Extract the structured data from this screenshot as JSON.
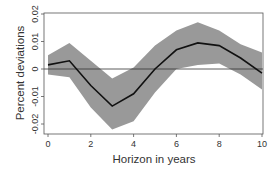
{
  "chart_data": {
    "type": "line",
    "title": "",
    "xlabel": "Horizon in years",
    "ylabel": "Percent deviations",
    "xlim": [
      0,
      10
    ],
    "ylim": [
      -0.022,
      0.021
    ],
    "xticks": [
      "0",
      "2",
      "4",
      "6",
      "8",
      "10"
    ],
    "yticks": [
      "-0.02",
      "-0.01",
      "0",
      "0.01",
      "0.02"
    ],
    "grid": false,
    "legend": null,
    "x": [
      0,
      1,
      2,
      3,
      4,
      5,
      6,
      7,
      8,
      9,
      10
    ],
    "series": [
      {
        "name": "Impulse response",
        "values": [
          0.0015,
          0.003,
          -0.006,
          -0.0135,
          -0.009,
          0.0,
          0.007,
          0.0095,
          0.0085,
          0.004,
          -0.0015
        ],
        "color": "#111111"
      },
      {
        "name": "Upper band",
        "values": [
          0.005,
          0.0095,
          0.003,
          -0.0035,
          0.0005,
          0.0085,
          0.014,
          0.017,
          0.014,
          0.009,
          0.006
        ],
        "color": "#999999"
      },
      {
        "name": "Lower band",
        "values": [
          -0.002,
          -0.003,
          -0.014,
          -0.022,
          -0.019,
          -0.0085,
          0.0,
          0.0015,
          0.002,
          -0.002,
          -0.0075
        ],
        "color": "#999999"
      }
    ],
    "reference_line": 0
  }
}
